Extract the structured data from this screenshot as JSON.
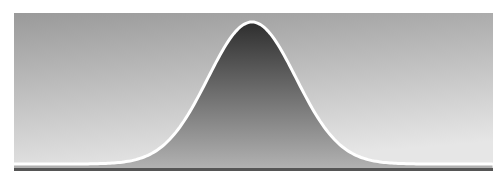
{
  "figure": {
    "colors": {
      "background_top": "#9a9a9a",
      "background_bottom": "#e6e6e6",
      "area_top": "#2e2e2e",
      "area_bottom": "#b4b4b4",
      "curve": "#ffffff",
      "baseline": "#555555",
      "page": "#ffffff"
    },
    "curve": {
      "type": "gaussian",
      "center_x": 238,
      "peak_y": 9,
      "baseline_y": 151,
      "sigma": 44
    }
  }
}
